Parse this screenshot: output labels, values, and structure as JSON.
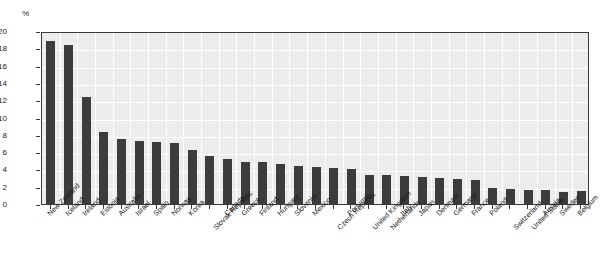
{
  "chart_data": {
    "type": "bar",
    "title": "",
    "subtitle": "",
    "xlabel": "",
    "ylabel": "",
    "unit_label": "%",
    "ylim": [
      0,
      20
    ],
    "ytick_step": 2,
    "yticks": [
      0,
      2,
      4,
      6,
      8,
      10,
      12,
      14,
      16,
      18,
      20
    ],
    "ytick_labels": [
      "0",
      "2",
      "4",
      "6",
      "8",
      "10",
      "12",
      "14",
      "16",
      "18",
      "20"
    ],
    "grid": true,
    "legend": "none",
    "bar_color": "#3c3c3c",
    "plot_background": "#ececec",
    "categories": [
      "New Zealand",
      "Iceland",
      "Ireland",
      "Estonia",
      "Australia",
      "Israel",
      "Spain",
      "Norway",
      "Korea",
      "Slovak Republic",
      "Canada",
      "Greece",
      "Finland",
      "Hungary",
      "Slovenia",
      "Mexico",
      "Czech Republic",
      "Portugal",
      "United Kingdom",
      "Netherlands",
      "Italy",
      "Japan",
      "Denmark",
      "Germany",
      "France",
      "Poland",
      "Switzerland",
      "United States",
      "Austria",
      "Sweden",
      "Belgium"
    ],
    "values": [
      18.8,
      18.4,
      12.4,
      8.3,
      7.5,
      7.3,
      7.2,
      7.0,
      6.3,
      5.6,
      5.2,
      4.9,
      4.8,
      4.6,
      4.4,
      4.3,
      4.2,
      4.0,
      3.4,
      3.3,
      3.2,
      3.1,
      3.0,
      2.9,
      2.8,
      1.8,
      1.7,
      1.6,
      1.6,
      1.4,
      1.5
    ],
    "label_rows": [
      0,
      0,
      0,
      0,
      0,
      0,
      0,
      0,
      0,
      1,
      0,
      0,
      0,
      0,
      0,
      0,
      1,
      0,
      1,
      1,
      0,
      0,
      0,
      0,
      0,
      0,
      1,
      1,
      0,
      0,
      0
    ]
  }
}
